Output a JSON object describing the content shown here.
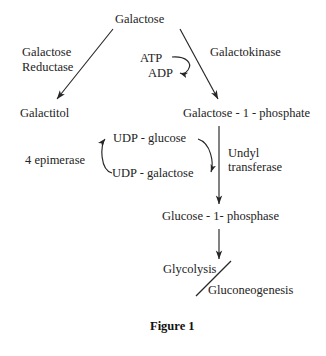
{
  "figure": {
    "caption": "Figure 1",
    "ink_color": "#232323"
  },
  "nodes": [
    {
      "id": "galactose",
      "label": "Galactose"
    },
    {
      "id": "galactitol",
      "label": "Galactitol"
    },
    {
      "id": "gal1p",
      "label": "Galactose - 1 - phosphate"
    },
    {
      "id": "udp_glucose",
      "label": "UDP - glucose"
    },
    {
      "id": "udp_galactose",
      "label": "UDP - galactose"
    },
    {
      "id": "glc1p",
      "label": "Glucose - 1- phosphase"
    },
    {
      "id": "glycolysis",
      "label": "Glycolysis"
    },
    {
      "id": "gluconeogenesis",
      "label": "Gluconeogenesis"
    }
  ],
  "enzymes": {
    "galactose_reductase_line1": "Galactose",
    "galactose_reductase_line2": "Reductase",
    "galactokinase": "Galactokinase",
    "epimerase": "4 epimerase",
    "undyl_transferase_line1": "Undyl",
    "undyl_transferase_line2": "transferase"
  },
  "cofactors": {
    "atp": "ATP",
    "adp": "ADP"
  }
}
